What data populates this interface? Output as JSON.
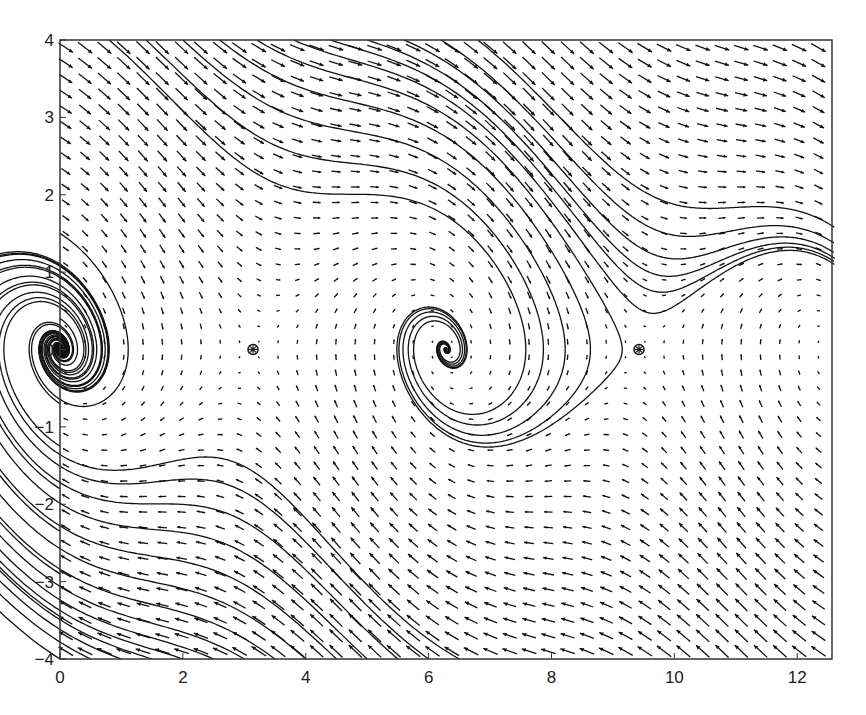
{
  "chart_data": {
    "type": "quiver+streamlines",
    "title": "",
    "xlabel": "",
    "ylabel": "",
    "xlim": [
      0,
      12.566
    ],
    "ylim": [
      -4,
      4
    ],
    "xticks": [
      "0",
      "2",
      "4",
      "6",
      "8",
      "10",
      "12"
    ],
    "xtick_values": [
      0,
      2,
      4,
      6,
      8,
      10,
      12
    ],
    "yticks": [
      "-4",
      "-3",
      "-2",
      "-1",
      "0",
      "1",
      "2",
      "3",
      "4"
    ],
    "ytick_values": [
      -4,
      -3,
      -2,
      -1,
      0,
      1,
      2,
      3,
      4
    ],
    "grid": false,
    "legend": null,
    "equilibria": [
      {
        "x": 3.1416,
        "y": 0,
        "marker": "circled-asterisk"
      },
      {
        "x": 9.4248,
        "y": 0,
        "marker": "circled-asterisk"
      }
    ],
    "field": {
      "damping": 0.5,
      "dx": "y",
      "dy": "-sin(x) - 0.5*y"
    },
    "colors": {
      "line": "#111111",
      "arrow": "#111111",
      "axis": "#333333"
    }
  }
}
